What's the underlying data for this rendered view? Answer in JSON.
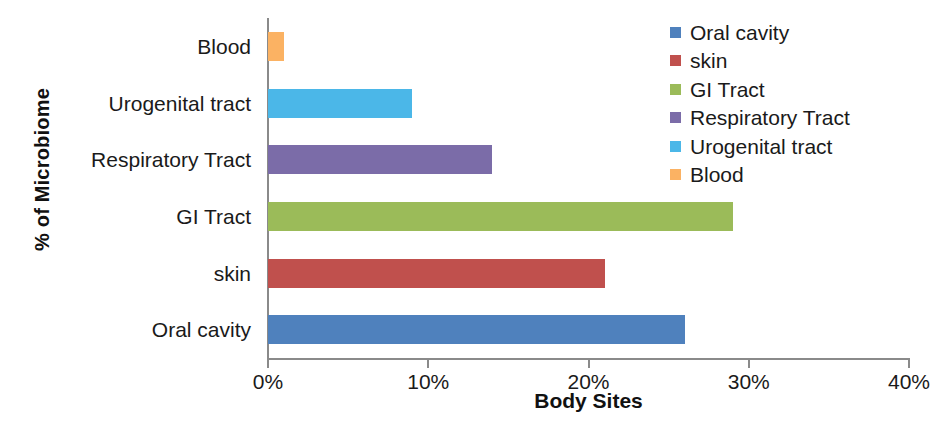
{
  "chart_data": {
    "type": "bar",
    "orientation": "horizontal",
    "title": "",
    "xlabel": "Body Sites",
    "ylabel": "% of Microbiome",
    "categories": [
      "Oral cavity",
      "skin",
      "GI Tract",
      "Respiratory Tract",
      "Urogenital tract",
      "Blood"
    ],
    "values": [
      26,
      21,
      29,
      14,
      9,
      1
    ],
    "value_labels": [
      "26%",
      "21%",
      "29%",
      "14%",
      "9%",
      "1%"
    ],
    "colors": [
      "#4f81bd",
      "#c0504d",
      "#9bbb59",
      "#7b6ca8",
      "#4bb7e8",
      "#fbb263"
    ],
    "xlim": [
      0,
      40
    ],
    "x_ticks": [
      0,
      10,
      20,
      30,
      40
    ],
    "x_tick_labels": [
      "0%",
      "10%",
      "20%",
      "30%",
      "40%"
    ],
    "grid": false,
    "legend_position": "top-right",
    "legend": [
      {
        "label": "Oral cavity",
        "color": "#4f81bd"
      },
      {
        "label": "skin",
        "color": "#c0504d"
      },
      {
        "label": "GI Tract",
        "color": "#9bbb59"
      },
      {
        "label": "Respiratory Tract",
        "color": "#7b6ca8"
      },
      {
        "label": "Urogenital tract",
        "color": "#4bb7e8"
      },
      {
        "label": "Blood",
        "color": "#fbb263"
      }
    ]
  },
  "axis": {
    "x_title": "Body Sites",
    "y_title": "% of Microbiome"
  }
}
